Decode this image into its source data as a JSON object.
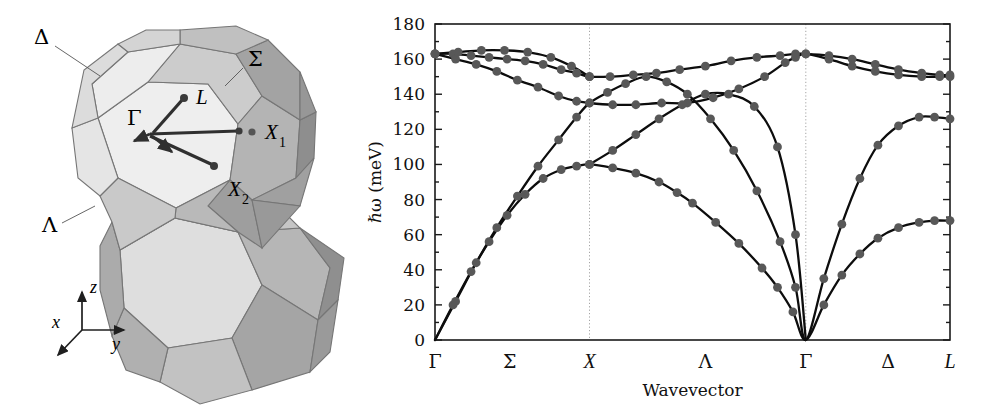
{
  "figure": {
    "panels": [
      "brillouin-zone",
      "phonon-dispersion"
    ]
  },
  "brillouin_zone": {
    "caption": "",
    "labels": {
      "delta": "Δ",
      "sigma": "Σ",
      "lambda": "Λ",
      "gamma": "Γ",
      "l_point": "L",
      "x1_point": "X",
      "x1_sub": "1",
      "x2_point": "X",
      "x2_sub": "2"
    },
    "axes_indicator": {
      "x": "x",
      "y": "y",
      "z": "z"
    },
    "colors": {
      "face_light": "#ececec",
      "face_mid": "#c9c9c9",
      "face_dark": "#a9a9a9",
      "face_darker": "#939393",
      "edge": "#6e6e6e",
      "arrow": "#3a3a3a"
    }
  },
  "chart_data": {
    "type": "line",
    "title": "",
    "xlabel": "Wavevector",
    "ylabel": "ℏω (meV)",
    "ylim": [
      0,
      180
    ],
    "ytick_values": [
      0,
      20,
      40,
      60,
      80,
      100,
      120,
      140,
      160,
      180
    ],
    "ytick_labels": [
      "0",
      "20",
      "40",
      "60",
      "80",
      "100",
      "120",
      "140",
      "160",
      "180"
    ],
    "ytick_minor_step": 10,
    "grid": "vertical-dotted-at-symmetry-points",
    "legend": "none",
    "xaxis": {
      "segments": [
        "Σ",
        "Λ",
        "Δ"
      ],
      "tick_positions": [
        0.0,
        0.145,
        0.3,
        0.525,
        0.72,
        0.88,
        1.0
      ],
      "tick_labels": [
        "Γ",
        "Σ",
        "X",
        "Λ",
        "Γ",
        "Δ",
        "L"
      ],
      "tick_italic": [
        false,
        false,
        true,
        false,
        false,
        false,
        true
      ],
      "gridline_positions": [
        0.3,
        0.72
      ],
      "symmetry_points": [
        "Γ",
        "X",
        "Γ",
        "L"
      ]
    },
    "marker": {
      "shape": "circle",
      "color": "#585858",
      "size_px": 4.4
    },
    "line_color": "#0d0d0d",
    "series": [
      {
        "name": "TA (transverse acoustic)",
        "x": [
          0.0,
          0.035,
          0.07,
          0.105,
          0.14,
          0.175,
          0.21,
          0.245,
          0.275,
          0.3,
          0.345,
          0.39,
          0.435,
          0.47,
          0.5,
          0.545,
          0.59,
          0.635,
          0.665,
          0.695,
          0.72,
          0.755,
          0.79,
          0.825,
          0.86,
          0.9,
          0.94,
          0.97,
          1.0
        ],
        "y": [
          0,
          20,
          39,
          56,
          71,
          83,
          92,
          97,
          99,
          100,
          98,
          95,
          90,
          84,
          78,
          67,
          55,
          41,
          30,
          16,
          0,
          20,
          37,
          49,
          58,
          64,
          67,
          68,
          68
        ]
      },
      {
        "name": "LA (longitudinal acoustic)",
        "x": [
          0.0,
          0.04,
          0.08,
          0.12,
          0.16,
          0.2,
          0.24,
          0.275,
          0.3,
          0.335,
          0.37,
          0.41,
          0.45,
          0.49,
          0.535,
          0.58,
          0.625,
          0.67,
          0.7,
          0.72,
          0.755,
          0.79,
          0.825,
          0.86,
          0.9,
          0.94,
          0.97,
          1.0
        ],
        "y": [
          0,
          22,
          44,
          64,
          82,
          99,
          114,
          127,
          135,
          141,
          146,
          150,
          147,
          140,
          126,
          108,
          85,
          56,
          30,
          0,
          35,
          66,
          92,
          111,
          122,
          127,
          127,
          126
        ]
      },
      {
        "name": "TO (transverse optic)",
        "x": [
          0.0,
          0.035,
          0.07,
          0.105,
          0.14,
          0.175,
          0.21,
          0.245,
          0.275,
          0.3,
          0.34,
          0.385,
          0.43,
          0.475,
          0.525,
          0.575,
          0.625,
          0.67,
          0.7,
          0.72,
          0.765,
          0.81,
          0.855,
          0.9,
          0.945,
          0.98,
          1.0
        ],
        "y": [
          163,
          163,
          162,
          161,
          160,
          159,
          157,
          154,
          152,
          150,
          150,
          151,
          152,
          154,
          156,
          159,
          161,
          162,
          163,
          163,
          162,
          160,
          157,
          154,
          152,
          151,
          151
        ]
      },
      {
        "name": "LO (longitudinal optic)",
        "x": [
          0.0,
          0.04,
          0.08,
          0.12,
          0.16,
          0.2,
          0.24,
          0.275,
          0.3,
          0.345,
          0.39,
          0.44,
          0.49,
          0.54,
          0.59,
          0.64,
          0.68,
          0.7,
          0.72,
          0.765,
          0.81,
          0.855,
          0.9,
          0.945,
          0.98,
          1.0
        ],
        "y": [
          163,
          160,
          157,
          153,
          148,
          144,
          139,
          136,
          135,
          134,
          134,
          135,
          135,
          138,
          143,
          150,
          158,
          161,
          163,
          160,
          156,
          153,
          151,
          150,
          150,
          150
        ]
      },
      {
        "name": "TO2 (upper branch Σ)",
        "x": [
          0.0,
          0.045,
          0.09,
          0.135,
          0.18,
          0.225,
          0.265,
          0.3
        ],
        "y": [
          163,
          164,
          165,
          165,
          164,
          161,
          156,
          150
        ]
      },
      {
        "name": "branch crossing X-Λ lower",
        "x": [
          0.3,
          0.345,
          0.39,
          0.435,
          0.48,
          0.525,
          0.57,
          0.62,
          0.665,
          0.7,
          0.72
        ],
        "y": [
          100,
          108,
          117,
          126,
          134,
          140,
          140,
          133,
          110,
          60,
          0
        ]
      }
    ],
    "scatter_points": {
      "description": "experimental neutron-scattering points overlaid on all branches",
      "color": "#585858"
    }
  }
}
